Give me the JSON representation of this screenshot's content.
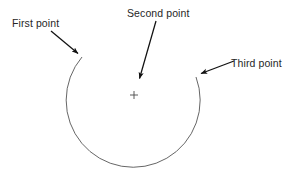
{
  "figure": {
    "background_color": "#ffffff",
    "stroke_color": "#3c3c3c",
    "arrow_color": "#111111",
    "text_color": "#262626",
    "labels": {
      "first": "First point",
      "second": "Second point",
      "third": "Third point"
    },
    "center_marker": {
      "name": "plus-marker",
      "glyph": "+",
      "x": 134,
      "y": 95
    },
    "arc": {
      "name": "open-circle-arc",
      "center_x": 135,
      "center_y": 88,
      "radius": 67,
      "start_point_x": 82,
      "start_point_y": 57,
      "end_point_x": 196,
      "end_point_y": 77,
      "description": "open arc sweeping clockwise from upper-left start point down around the bottom to the upper-right end point"
    },
    "arrows": [
      {
        "name": "arrow-to-first-point",
        "x1": 51,
        "y1": 31,
        "x2": 80,
        "y2": 55
      },
      {
        "name": "arrow-to-second-point",
        "x1": 156,
        "y1": 21,
        "x2": 138,
        "y2": 83
      },
      {
        "name": "arrow-to-third-point",
        "x1": 234,
        "y1": 61,
        "x2": 197,
        "y2": 75
      }
    ]
  }
}
